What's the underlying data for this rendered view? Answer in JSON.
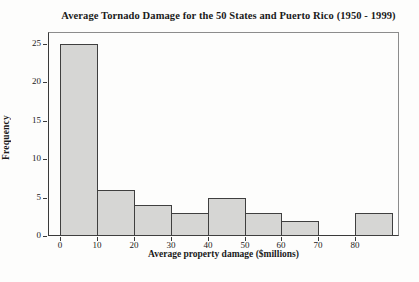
{
  "chart_data": {
    "type": "bar",
    "subtype": "histogram",
    "title": "Average Tornado Damage for the 50 States and Puerto Rico (1950 - 1999)",
    "xlabel": "Average property damage ($millions)",
    "ylabel": "Frequency",
    "bin_edges": [
      0,
      10,
      20,
      30,
      40,
      50,
      60,
      70,
      80,
      90
    ],
    "categories": [
      "0-10",
      "10-20",
      "20-30",
      "30-40",
      "40-50",
      "50-60",
      "60-70",
      "70-80",
      "80-90"
    ],
    "values": [
      25,
      6,
      4,
      3,
      5,
      3,
      2,
      0,
      3
    ],
    "x_ticks": [
      0,
      10,
      20,
      30,
      40,
      50,
      60,
      70,
      80
    ],
    "y_ticks": [
      0,
      5,
      10,
      15,
      20,
      25
    ],
    "xlim": [
      -3.2,
      91.8
    ],
    "ylim": [
      0,
      26.5
    ],
    "grid": false,
    "legend": "none",
    "colors": {
      "bar_fill": "#d6d6d4",
      "bar_border": "#3f3f3f",
      "axis": "#3a3a3a",
      "frame": "#8c8c8c",
      "text": "#1a1a1a",
      "background": "#fdfdfc"
    }
  }
}
